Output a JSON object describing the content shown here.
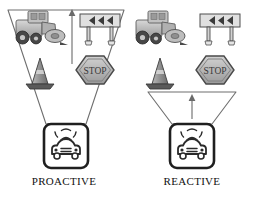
{
  "diagram": {
    "title_visible": false,
    "background_color": "#ffffff",
    "outline_color": "#4a4a4a",
    "panels": [
      {
        "id": "proactive",
        "caption": "PROACTIVE",
        "funnel": {
          "position": "above-vehicle",
          "orientation": "inverted-trapezoid",
          "encloses_icons": true,
          "arrow_direction": "up"
        },
        "icons": [
          {
            "name": "road-roller-icon",
            "label": "Road roller"
          },
          {
            "name": "chevron-barricade-sign-icon",
            "label": "Chevron barricade sign",
            "chevron_count": 3,
            "chevron_direction": "left"
          },
          {
            "name": "traffic-cone-icon",
            "label": "Traffic cone"
          },
          {
            "name": "stop-sign-icon",
            "label": "STOP",
            "sign_text": "STOP"
          }
        ],
        "vehicle": {
          "name": "car-front-icon",
          "label": "Car with roof light bar"
        }
      },
      {
        "id": "reactive",
        "caption": "REACTIVE",
        "funnel": {
          "position": "below-icons",
          "orientation": "inverted-trapezoid",
          "encloses_icons": false,
          "arrow_direction": "up"
        },
        "icons": [
          {
            "name": "road-roller-icon",
            "label": "Road roller"
          },
          {
            "name": "chevron-barricade-sign-icon",
            "label": "Chevron barricade sign",
            "chevron_count": 3,
            "chevron_direction": "left"
          },
          {
            "name": "traffic-cone-icon",
            "label": "Traffic cone"
          },
          {
            "name": "stop-sign-icon",
            "label": "STOP",
            "sign_text": "STOP"
          }
        ],
        "vehicle": {
          "name": "car-front-icon",
          "label": "Car with roof light bar"
        }
      }
    ],
    "colors": {
      "line": "#5a5a5a",
      "vehicle_frame": "#1f1f1f",
      "icon_dark": "#4f4f4f",
      "icon_mid": "#8d8d8d",
      "icon_light": "#c9c9c9",
      "icon_pale": "#e2e2e2",
      "caption_text": "#111111"
    }
  }
}
